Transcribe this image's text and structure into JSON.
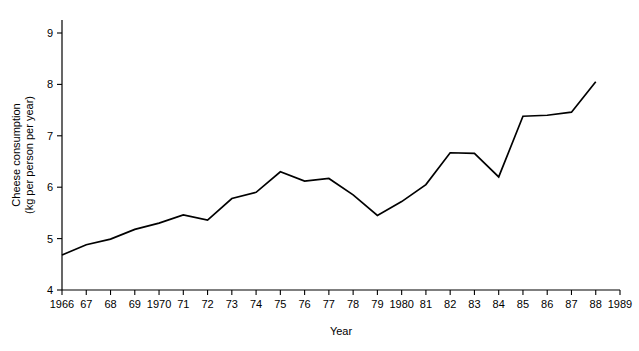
{
  "chart_data": {
    "type": "line",
    "title": "",
    "xlabel": "Year",
    "ylabel": "Cheese consumption (kg per person per year)",
    "ylabel_line1": "Cheese consumption",
    "ylabel_line2": "(kg per person per year)",
    "grid": false,
    "legend": "none",
    "xlim": [
      1966,
      1989
    ],
    "ylim": [
      4,
      9
    ],
    "ytick_values": [
      4,
      5,
      6,
      7,
      8,
      9
    ],
    "ytick_labels": [
      "4",
      "5",
      "6",
      "7",
      "8",
      "9"
    ],
    "xtick_values": [
      1966,
      1967,
      1968,
      1969,
      1970,
      1971,
      1972,
      1973,
      1974,
      1975,
      1976,
      1977,
      1978,
      1979,
      1980,
      1981,
      1982,
      1983,
      1984,
      1985,
      1986,
      1987,
      1988,
      1989
    ],
    "xtick_labels": [
      "1966",
      "67",
      "68",
      "69",
      "1970",
      "71",
      "72",
      "73",
      "74",
      "75",
      "76",
      "77",
      "78",
      "79",
      "1980",
      "81",
      "82",
      "83",
      "84",
      "85",
      "86",
      "87",
      "88",
      "1989"
    ],
    "x": [
      1966,
      1967,
      1968,
      1969,
      1970,
      1971,
      1972,
      1973,
      1974,
      1975,
      1976,
      1977,
      1978,
      1979,
      1980,
      1981,
      1982,
      1983,
      1984,
      1985,
      1986,
      1987,
      1988
    ],
    "values": [
      4.68,
      4.88,
      4.99,
      5.18,
      5.3,
      5.46,
      5.36,
      5.78,
      5.9,
      6.3,
      6.12,
      6.17,
      5.85,
      5.45,
      5.72,
      6.05,
      6.67,
      6.66,
      6.2,
      7.38,
      7.4,
      7.46,
      8.05
    ],
    "series": [
      {
        "name": "Cheese consumption",
        "color": "#000000",
        "values": [
          4.68,
          4.88,
          4.99,
          5.18,
          5.3,
          5.46,
          5.36,
          5.78,
          5.9,
          6.3,
          6.12,
          6.17,
          5.85,
          5.45,
          5.72,
          6.05,
          6.67,
          6.66,
          6.2,
          7.38,
          7.4,
          7.46,
          8.05
        ]
      }
    ]
  }
}
